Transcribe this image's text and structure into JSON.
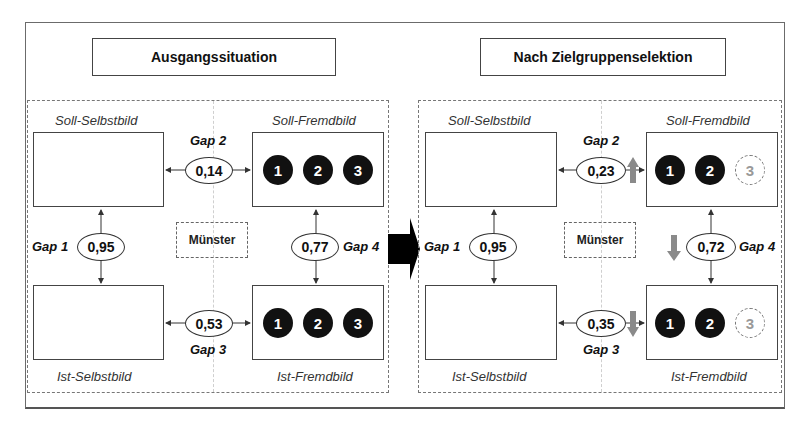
{
  "panels": [
    {
      "id": "ausgangssituation",
      "title": "Ausgangssituation",
      "labels": {
        "soll_selbst": "Soll-Selbstbild",
        "soll_fremd": "Soll-Fremdbild",
        "ist_selbst": "Ist-Selbstbild",
        "ist_fremd": "Ist-Fremdbild"
      },
      "city": "Münster",
      "gaps": {
        "gap1": {
          "label": "Gap 1",
          "value": "0,95"
        },
        "gap2": {
          "label": "Gap 2",
          "value": "0,14"
        },
        "gap3": {
          "label": "Gap 3",
          "value": "0,53"
        },
        "gap4": {
          "label": "Gap 4",
          "value": "0,77"
        }
      },
      "soll_fremd_groups": [
        {
          "n": "1",
          "active": true
        },
        {
          "n": "2",
          "active": true
        },
        {
          "n": "3",
          "active": true
        }
      ],
      "ist_fremd_groups": [
        {
          "n": "1",
          "active": true
        },
        {
          "n": "2",
          "active": true
        },
        {
          "n": "3",
          "active": true
        }
      ]
    },
    {
      "id": "nach-zielgruppenselektion",
      "title": "Nach Zielgruppenselektion",
      "labels": {
        "soll_selbst": "Soll-Selbstbild",
        "soll_fremd": "Soll-Fremdbild",
        "ist_selbst": "Ist-Selbstbild",
        "ist_fremd": "Ist-Fremdbild"
      },
      "city": "Münster",
      "gaps": {
        "gap1": {
          "label": "Gap 1",
          "value": "0,95",
          "trend": "none"
        },
        "gap2": {
          "label": "Gap 2",
          "value": "0,23",
          "trend": "up"
        },
        "gap3": {
          "label": "Gap 3",
          "value": "0,35",
          "trend": "down"
        },
        "gap4": {
          "label": "Gap 4",
          "value": "0,72",
          "trend": "down"
        }
      },
      "soll_fremd_groups": [
        {
          "n": "1",
          "active": true
        },
        {
          "n": "2",
          "active": true
        },
        {
          "n": "3",
          "active": false
        }
      ],
      "ist_fremd_groups": [
        {
          "n": "1",
          "active": true
        },
        {
          "n": "2",
          "active": true
        },
        {
          "n": "3",
          "active": false
        }
      ]
    }
  ],
  "colors": {
    "trend_arrow": "#8a8a8a",
    "transition_arrow": "#000000",
    "active_group": "#111111",
    "inactive_group_text": "#999999"
  }
}
